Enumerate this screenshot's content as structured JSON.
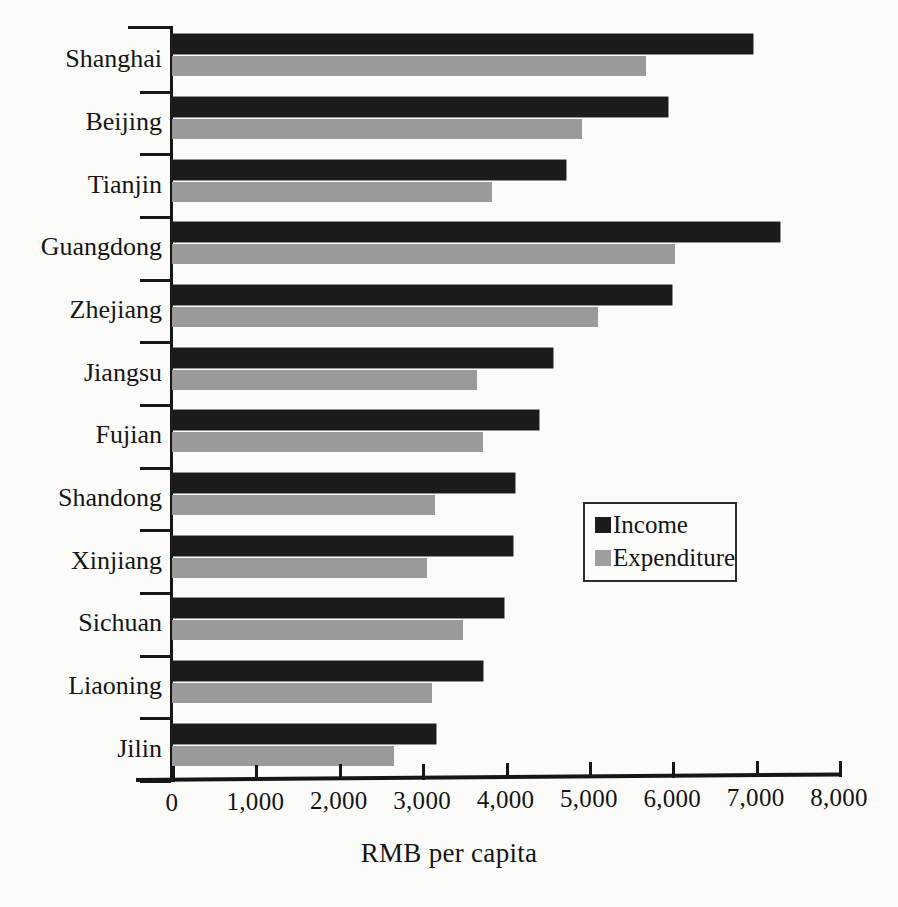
{
  "chart_data": {
    "type": "bar",
    "orientation": "horizontal",
    "title": "",
    "xlabel": "RMB per capita",
    "ylabel": "",
    "xlim": [
      0,
      8000
    ],
    "xticks": [
      0,
      1000,
      2000,
      3000,
      4000,
      5000,
      6000,
      7000,
      8000
    ],
    "xtick_labels": [
      "0",
      "1,000",
      "2,000",
      "3,000",
      "4,000",
      "5,000",
      "6,000",
      "7,000",
      "8,000"
    ],
    "grid": false,
    "legend_position": "center-right",
    "categories": [
      "Shanghai",
      "Beijing",
      "Tianjin",
      "Guangdong",
      "Zhejiang",
      "Jiangsu",
      "Fujian",
      "Shandong",
      "Xinjiang",
      "Sichuan",
      "Liaoning",
      "Jilin"
    ],
    "series": [
      {
        "name": "Income",
        "color": "#1b1b1b",
        "values": [
          6970,
          5950,
          4730,
          7290,
          6000,
          4570,
          4400,
          4110,
          4090,
          3980,
          3730,
          3170
        ]
      },
      {
        "name": "Expenditure",
        "color": "#9a9a9a",
        "values": [
          5690,
          4920,
          3840,
          6030,
          5110,
          3660,
          3730,
          3150,
          3060,
          3490,
          3120,
          2660
        ]
      }
    ]
  },
  "legend": {
    "items": [
      {
        "label": "Income",
        "swatch": "income"
      },
      {
        "label": "Expenditure",
        "swatch": "expenditure"
      }
    ]
  },
  "axis": {
    "x_title": "RMB per capita"
  },
  "page": {
    "bleed_text": ""
  }
}
